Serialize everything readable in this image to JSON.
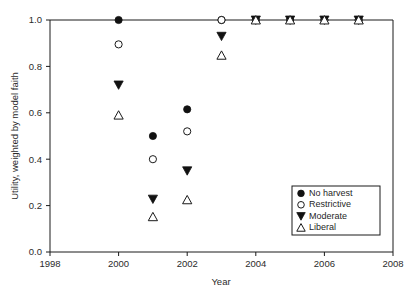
{
  "chart_data": {
    "type": "scatter",
    "title": "",
    "xlabel": "Year",
    "ylabel": "Utility, weighted by model faith",
    "xlim": [
      1998,
      2008
    ],
    "ylim": [
      0.0,
      1.0
    ],
    "xticks": [
      1998,
      2000,
      2002,
      2004,
      2006,
      2008
    ],
    "xtick_labels": [
      "1998",
      "2000",
      "2002",
      "2004",
      "2006",
      "2008"
    ],
    "yticks": [
      0.0,
      0.2,
      0.4,
      0.6,
      0.8,
      1.0
    ],
    "ytick_labels": [
      "0.0",
      "0.2",
      "0.4",
      "0.6",
      "0.8",
      "1.0"
    ],
    "grid": false,
    "legend_position": "lower right",
    "x": [
      2000,
      2001,
      2002,
      2003,
      2004,
      2005,
      2006,
      2007
    ],
    "series": [
      {
        "name": "No harvest",
        "marker": "filled-circle",
        "color": "#111111",
        "values": [
          1.0,
          0.5,
          0.615,
          1.0,
          1.0,
          1.0,
          1.0,
          1.0
        ]
      },
      {
        "name": "Restrictive",
        "marker": "open-circle",
        "color": "#1a1a1a",
        "values": [
          0.895,
          0.4,
          0.52,
          1.0,
          1.0,
          1.0,
          1.0,
          1.0
        ]
      },
      {
        "name": "Moderate",
        "marker": "filled-triangle-down",
        "color": "#111111",
        "values": [
          0.72,
          0.228,
          0.35,
          0.93,
          1.0,
          1.0,
          1.0,
          1.0
        ]
      },
      {
        "name": "Liberal",
        "marker": "open-triangle-up",
        "color": "#1a1a1a",
        "values": [
          0.59,
          0.152,
          0.225,
          0.848,
          1.0,
          1.0,
          1.0,
          1.0
        ]
      }
    ]
  },
  "legend": {
    "entries": [
      {
        "label": "No harvest",
        "marker": "filled-circle"
      },
      {
        "label": "Restrictive",
        "marker": "open-circle"
      },
      {
        "label": "Moderate",
        "marker": "filled-triangle-down"
      },
      {
        "label": "Liberal",
        "marker": "open-triangle-up"
      }
    ]
  },
  "caption": {
    "text": ""
  }
}
